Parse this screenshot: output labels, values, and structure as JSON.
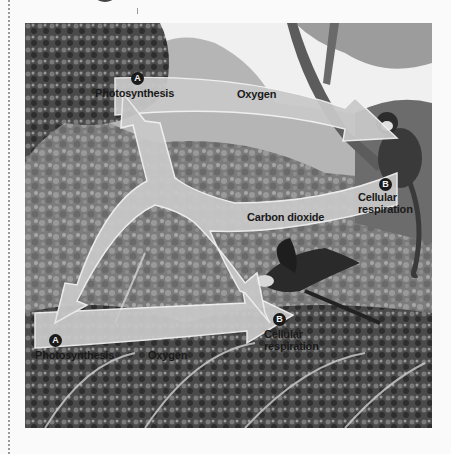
{
  "diagram": {
    "title": "",
    "processes": [
      {
        "badge": "A",
        "label": "Photosynthesis",
        "position": "top-left tree"
      },
      {
        "badge": "B",
        "label": "Cellular respiration",
        "position": "monkey (right)"
      },
      {
        "badge": "A",
        "label": "Photosynthesis",
        "position": "bottom-left plants"
      },
      {
        "badge": "B",
        "label": "Cellular respiration",
        "position": "parrot (center)"
      }
    ],
    "arrows": [
      {
        "label": "Oxygen",
        "from": "Photosynthesis (top)",
        "to": "Cellular respiration (monkey)"
      },
      {
        "label": "Oxygen",
        "from": "Photosynthesis (bottom)",
        "to": "Cellular respiration (parrot)"
      },
      {
        "label": "Carbon dioxide",
        "from": "Cellular respiration (monkey & parrot)",
        "to": "Photosynthesis (top & bottom)"
      }
    ],
    "labels": {
      "a_top_badge": "A",
      "a_top": "Photosynthesis",
      "oxygen_top": "Oxygen",
      "b_right_badge": "B",
      "b_right_line1": "Cellular",
      "b_right_line2": "respiration",
      "co2": "Carbon dioxide",
      "a_bottom_badge": "A",
      "a_bottom": "Photosynthesis",
      "oxygen_bottom": "Oxygen",
      "b_center_badge": "B",
      "b_center_line1": "Cellular",
      "b_center_line2": "respiration"
    },
    "colors": {
      "arrow_fill": "#c9c9c9",
      "arrow_outline": "#f4f4f4",
      "badge": "#1a1a1a",
      "text": "#1a1a1a"
    }
  }
}
